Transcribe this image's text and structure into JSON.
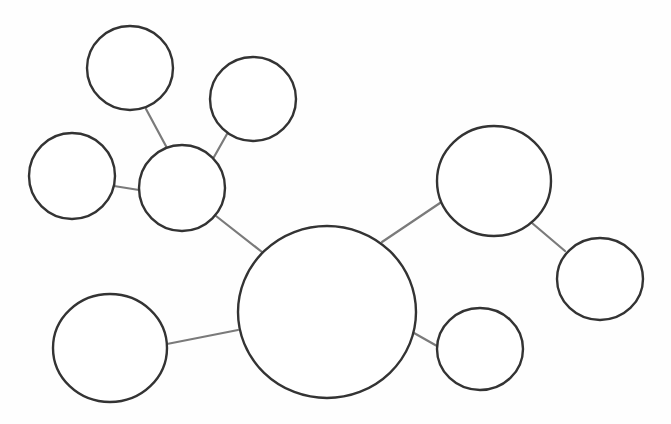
{
  "diagram": {
    "type": "cluster-map",
    "title": "",
    "colors": {
      "background": "#fefefe",
      "node_stroke": "#333333",
      "node_fill": "#ffffff",
      "edge_stroke": "#7a7a7a"
    },
    "stroke_widths": {
      "node": 2.4,
      "edge": 2.2
    },
    "nodes": [
      {
        "id": "center",
        "label": "",
        "cx": 327,
        "cy": 312,
        "rx": 89,
        "ry": 86
      },
      {
        "id": "hub-left",
        "label": "",
        "cx": 182,
        "cy": 188,
        "rx": 43,
        "ry": 43
      },
      {
        "id": "top",
        "label": "",
        "cx": 130,
        "cy": 68,
        "rx": 43,
        "ry": 42
      },
      {
        "id": "top-right-sm",
        "label": "",
        "cx": 253,
        "cy": 99,
        "rx": 43,
        "ry": 42
      },
      {
        "id": "far-left",
        "label": "",
        "cx": 72,
        "cy": 176,
        "rx": 43,
        "ry": 43
      },
      {
        "id": "lower-left",
        "label": "",
        "cx": 110,
        "cy": 348,
        "rx": 57,
        "ry": 54
      },
      {
        "id": "right-large",
        "label": "",
        "cx": 494,
        "cy": 181,
        "rx": 57,
        "ry": 55
      },
      {
        "id": "far-right",
        "label": "",
        "cx": 600,
        "cy": 279,
        "rx": 43,
        "ry": 41
      },
      {
        "id": "lower-right",
        "label": "",
        "cx": 480,
        "cy": 349,
        "rx": 43,
        "ry": 41
      }
    ],
    "edges": [
      {
        "from": "top",
        "to": "hub-left",
        "x1": 146,
        "y1": 109,
        "x2": 167,
        "y2": 148
      },
      {
        "from": "top-right-sm",
        "to": "hub-left",
        "x1": 227,
        "y1": 134,
        "x2": 214,
        "y2": 157
      },
      {
        "from": "far-left",
        "to": "hub-left",
        "x1": 114,
        "y1": 186,
        "x2": 139,
        "y2": 190
      },
      {
        "from": "hub-left",
        "to": "center",
        "x1": 216,
        "y1": 216,
        "x2": 262,
        "y2": 252
      },
      {
        "from": "lower-left",
        "to": "center",
        "x1": 167,
        "y1": 344,
        "x2": 238,
        "y2": 330
      },
      {
        "from": "center",
        "to": "right-large",
        "x1": 382,
        "y1": 242,
        "x2": 440,
        "y2": 203
      },
      {
        "from": "right-large",
        "to": "far-right",
        "x1": 532,
        "y1": 223,
        "x2": 565,
        "y2": 251
      },
      {
        "from": "center",
        "to": "lower-right",
        "x1": 414,
        "y1": 333,
        "x2": 437,
        "y2": 346
      }
    ]
  }
}
